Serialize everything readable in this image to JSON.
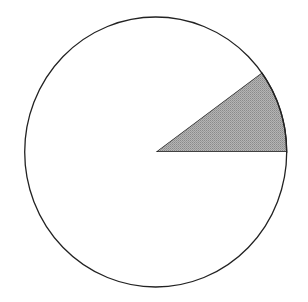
{
  "chart_data": {
    "type": "pie",
    "title": "",
    "labels": [
      "Shaded segment",
      "Remainder"
    ],
    "values": [
      10,
      90
    ],
    "colors": [
      "#a8a8a8",
      "#ffffff"
    ],
    "start_angle_deg": 0,
    "direction": "counterclockwise",
    "legend": "none",
    "annotations": []
  }
}
